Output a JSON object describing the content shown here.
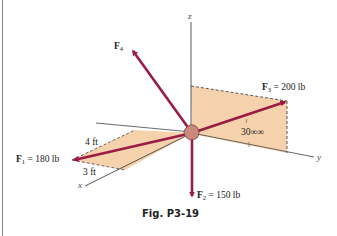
{
  "figure": {
    "caption": "Fig. P3-19",
    "axes": {
      "x": "x",
      "y": "y",
      "z": "z"
    },
    "forces": [
      {
        "id": "F1",
        "symbol": "F",
        "sub": "1",
        "value": " = 180 lb"
      },
      {
        "id": "F2",
        "symbol": "F",
        "sub": "2",
        "value": " = 150 lb"
      },
      {
        "id": "F3",
        "symbol": "F",
        "sub": "3",
        "value": " = 200 lb"
      },
      {
        "id": "F4",
        "symbol": "F",
        "sub": "4",
        "value": ""
      }
    ],
    "dimensions": {
      "d1": "4 ft",
      "d2": "3 ft"
    },
    "angle": "30∞∞",
    "colors": {
      "force": "#9b1b45",
      "plane": "#f6d2ac",
      "axis": "#555555",
      "dashed": "#444444"
    }
  }
}
